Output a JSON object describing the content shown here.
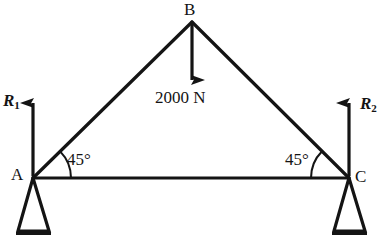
{
  "figure": {
    "type": "engineering-free-body-diagram",
    "stroke_color": "#141414",
    "background_color": "#ffffff"
  },
  "nodes": [
    {
      "id": "A",
      "label": "A",
      "x": 33,
      "y": 178
    },
    {
      "id": "B",
      "label": "B",
      "x": 192,
      "y": 22
    },
    {
      "id": "C",
      "label": "C",
      "x": 349,
      "y": 178
    }
  ],
  "members": [
    {
      "from": "A",
      "to": "B"
    },
    {
      "from": "B",
      "to": "C"
    },
    {
      "from": "A",
      "to": "C"
    }
  ],
  "angles": [
    {
      "at": "A",
      "label": "45°"
    },
    {
      "at": "C",
      "label": "45°"
    }
  ],
  "loads": [
    {
      "id": "apex-load",
      "label": "2000 N",
      "magnitude": 2000,
      "unit": "N",
      "direction": "down",
      "applied_at": "B"
    }
  ],
  "reactions": [
    {
      "id": "R1",
      "symbol": "R",
      "subscript": "1",
      "direction": "up",
      "applied_at": "A"
    },
    {
      "id": "R2",
      "symbol": "R",
      "subscript": "2",
      "direction": "up",
      "applied_at": "C"
    }
  ],
  "supports": [
    {
      "id": "support-A",
      "type": "pin-triangle",
      "at": "A"
    },
    {
      "id": "support-C",
      "type": "pin-triangle",
      "at": "C"
    }
  ]
}
